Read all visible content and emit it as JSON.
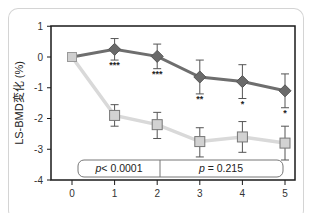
{
  "chart_data": {
    "type": "line",
    "title": "",
    "xlabel": "",
    "ylabel": "LS-BMD変化 (%)",
    "x": [
      0,
      1,
      2,
      3,
      4,
      5
    ],
    "x_tick_labels": [
      "0",
      "1",
      "2",
      "3",
      "4",
      "5"
    ],
    "y_ticks": [
      1,
      0,
      -1,
      -2,
      -3,
      -4
    ],
    "y_tick_labels": [
      "1",
      "0",
      "-1",
      "-2",
      "-3",
      "-4"
    ],
    "xlim": [
      -0.5,
      5.25
    ],
    "ylim": [
      -4,
      1
    ],
    "grid": false,
    "legend": null,
    "series": [
      {
        "name": "diamond-series",
        "marker": "diamond",
        "color": "#6e6e6e",
        "line_color": "#6e6e6e",
        "values": [
          0,
          0.25,
          0.02,
          -0.65,
          -0.8,
          -1.1
        ],
        "error_low": [
          0,
          0.35,
          0.4,
          0.55,
          0.55,
          0.55
        ],
        "error_high": [
          0,
          0.35,
          0.4,
          0.55,
          0.55,
          0.55
        ],
        "significance": [
          "",
          "***",
          "***",
          "**",
          "*",
          "*"
        ]
      },
      {
        "name": "square-series",
        "marker": "square",
        "color": "#cccccc",
        "line_color": "#d9d9d9",
        "values": [
          0,
          -1.9,
          -2.2,
          -2.75,
          -2.6,
          -2.8
        ],
        "error_low": [
          0,
          0.35,
          0.45,
          0.5,
          0.5,
          0.55
        ],
        "error_high": [
          0,
          0.35,
          0.4,
          0.45,
          0.5,
          0.55
        ]
      }
    ],
    "annotations": [
      {
        "text_italic": "p",
        "text": "< 0.0001",
        "x_range": [
          0,
          2
        ]
      },
      {
        "text_italic": "p",
        "text": " = 0.215",
        "x_range": [
          2,
          5
        ]
      }
    ]
  },
  "labels": {
    "ylabel": "LS-BMD変化 (%)",
    "p1_italic": "p",
    "p1_rest": "< 0.0001",
    "p2_italic": "p",
    "p2_rest": " = 0.215"
  }
}
